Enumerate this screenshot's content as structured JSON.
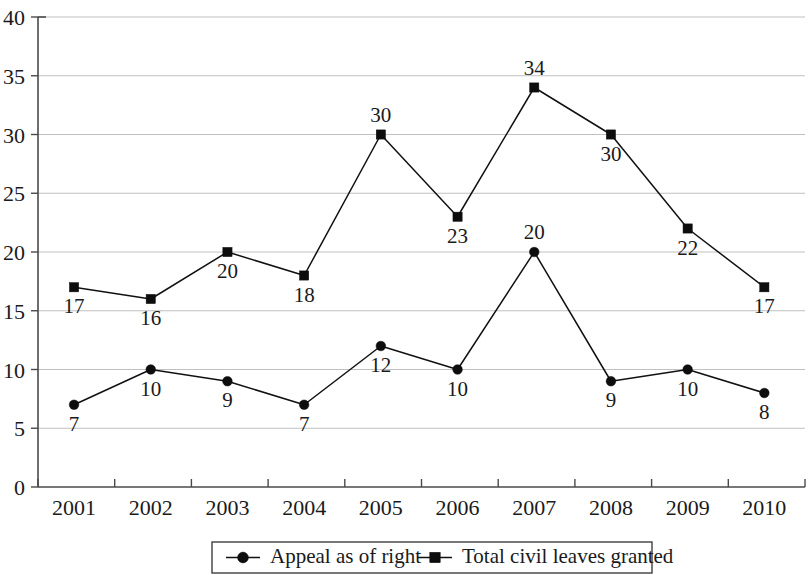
{
  "chart_data": {
    "type": "line",
    "title": "",
    "subtitle": "",
    "xlabel": "",
    "ylabel": "",
    "categories": [
      "2001",
      "2002",
      "2003",
      "2004",
      "2005",
      "2006",
      "2007",
      "2008",
      "2009",
      "2010"
    ],
    "series": [
      {
        "name": "Appeal as of right",
        "marker": "circle",
        "color": "#111111",
        "values": [
          7,
          10,
          9,
          7,
          12,
          10,
          20,
          9,
          10,
          8
        ],
        "labels": [
          "7",
          "10",
          "9",
          "7",
          "12",
          "10",
          "20",
          "9",
          "10",
          "8"
        ],
        "label_positions": [
          "below",
          "below",
          "below",
          "below",
          "below",
          "below",
          "above",
          "below",
          "below",
          "below"
        ]
      },
      {
        "name": "Total civil leaves granted",
        "marker": "square",
        "color": "#111111",
        "values": [
          17,
          16,
          20,
          18,
          30,
          23,
          34,
          30,
          22,
          17
        ],
        "labels": [
          "17",
          "16",
          "20",
          "18",
          "30",
          "23",
          "34",
          "30",
          "22",
          "17"
        ],
        "label_positions": [
          "below",
          "below",
          "below",
          "below",
          "above",
          "below",
          "above",
          "below",
          "below",
          "below"
        ]
      }
    ],
    "ylim": [
      0,
      40
    ],
    "ytick_step": 5,
    "yticks": [
      "0",
      "5",
      "10",
      "15",
      "20",
      "25",
      "30",
      "35",
      "40"
    ],
    "grid": true,
    "grid_axis": "y",
    "legend_position": "bottom",
    "legend_border": true
  },
  "legend": {
    "entries": [
      {
        "label": "Appeal as of right",
        "marker": "circle"
      },
      {
        "label": "Total civil leaves granted",
        "marker": "square"
      }
    ]
  }
}
